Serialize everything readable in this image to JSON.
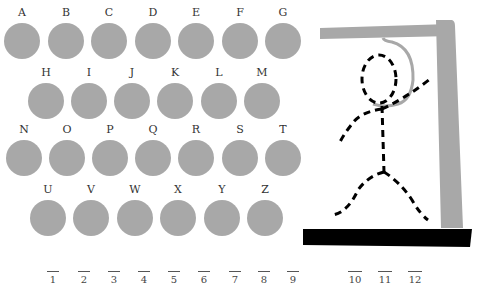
{
  "letters": {
    "rows": [
      [
        "A",
        "B",
        "C",
        "D",
        "E",
        "F",
        "G"
      ],
      [
        "H",
        "I",
        "J",
        "K",
        "L",
        "M"
      ],
      [
        "N",
        "O",
        "P",
        "Q",
        "R",
        "S",
        "T"
      ],
      [
        "U",
        "V",
        "W",
        "X",
        "Y",
        "Z"
      ]
    ]
  },
  "slots": [
    "1",
    "2",
    "3",
    "4",
    "5",
    "6",
    "7",
    "8",
    "9",
    "10",
    "11",
    "12"
  ],
  "colors": {
    "disc": "#a8a8a8",
    "gallows": "#a8a8a8",
    "ground": "#000000",
    "figure": "#000000"
  }
}
